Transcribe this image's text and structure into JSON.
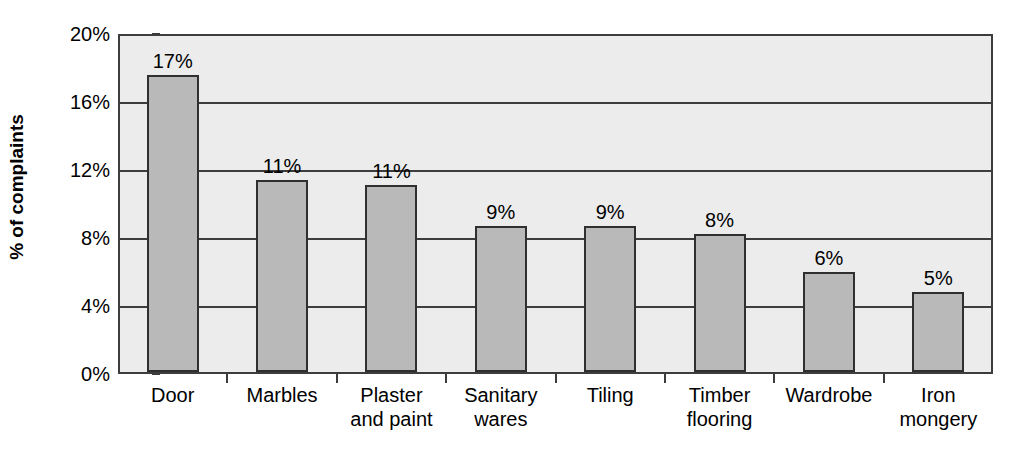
{
  "chart_data": {
    "type": "bar",
    "title": "",
    "xlabel": "",
    "ylabel": "% of complaints",
    "categories": [
      "Door",
      "Marbles",
      "Plaster\nand paint",
      "Sanitary\nwares",
      "Tiling",
      "Timber\nflooring",
      "Wardrobe",
      "Iron\nmongery"
    ],
    "values": [
      17.5,
      11.3,
      11.0,
      8.6,
      8.6,
      8.1,
      5.9,
      4.7
    ],
    "data_labels": [
      "17%",
      "11%",
      "11%",
      "9%",
      "9%",
      "8%",
      "6%",
      "5%"
    ],
    "ylim": [
      0,
      20
    ],
    "ytick_values": [
      0,
      4,
      8,
      12,
      16,
      20
    ],
    "ytick_labels": [
      "0%",
      "4%",
      "8%",
      "12%",
      "16%",
      "20%"
    ],
    "grid": true,
    "legend": "none",
    "colors": {
      "bar_fill": "#b9b9ba",
      "bar_border": "#2f2f2f",
      "plot_background": "#ececed",
      "gridline": "#3d3d3d",
      "page_background": "#ffffff",
      "text": "#000000"
    }
  }
}
